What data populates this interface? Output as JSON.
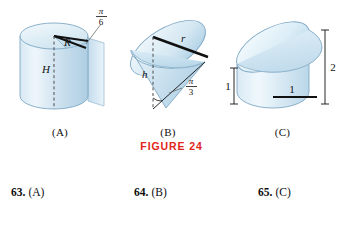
{
  "figure": {
    "caption": "FIGURE 24",
    "caption_color": "#e1251b",
    "panels": [
      {
        "id": "A",
        "label": "(A)",
        "shape": "cylinder-with-wedge-cut",
        "labels": {
          "radius": "R",
          "height": "H",
          "angle_numerator": "π",
          "angle_denominator": "6"
        }
      },
      {
        "id": "B",
        "label": "(B)",
        "shape": "cone-with-slanted-cut",
        "labels": {
          "radius": "r",
          "height": "h",
          "angle_numerator": "π",
          "angle_denominator": "3"
        }
      },
      {
        "id": "C",
        "label": "(C)",
        "shape": "cylinder-with-slanted-top",
        "labels": {
          "left_height": "1",
          "right_height": "2",
          "base_radius": "1"
        }
      }
    ]
  },
  "exercises": [
    {
      "number": "63.",
      "answer": "(A)"
    },
    {
      "number": "64.",
      "answer": "(B)"
    },
    {
      "number": "65.",
      "answer": "(C)"
    }
  ],
  "colors": {
    "solid_fill_light": "#e8f2f8",
    "solid_fill_mid": "#cfe2ef",
    "solid_fill_deep": "#b6d4e6",
    "outline": "#7fa8c4",
    "annotation": "#111111",
    "caption_red": "#e1251b"
  }
}
